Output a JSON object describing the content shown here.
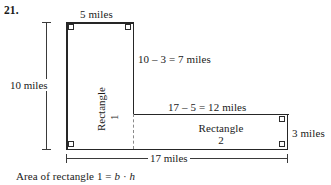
{
  "problem": {
    "number": "21."
  },
  "figure": {
    "type": "composite-l-shape-rectangle",
    "labels": {
      "top_width": "5 miles",
      "left_height": "10 miles",
      "inner_vertical": "10 – 3 = 7 miles",
      "inner_horizontal": "17 – 5 = 12 miles",
      "right_height": "3 miles",
      "bottom_width": "17 miles"
    },
    "regions": [
      {
        "name_line1": "Rectangle",
        "name_line2": "1"
      },
      {
        "name_line1": "Rectangle",
        "name_line2": "2"
      }
    ]
  },
  "formula": {
    "prefix": "Area of rectangle 1  =  ",
    "base_var": "b",
    "operator": " · ",
    "height_var": "h"
  },
  "colors": {
    "outline": "#262626",
    "dashed": "#8a8a8a",
    "dimension": "#3a3a3a",
    "text": "#1a1a1a",
    "background": "#ffffff"
  }
}
